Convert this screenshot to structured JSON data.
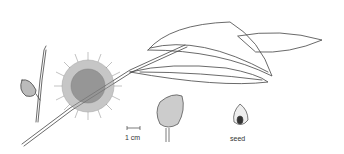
{
  "illustration": {
    "subject": "botanical line drawing of a branch with spherical flower head, leaves, fruit and seed",
    "scale_label": "1 cm",
    "seed_label": "seed",
    "colors": {
      "ink": "#333333",
      "background": "#ffffff"
    }
  }
}
